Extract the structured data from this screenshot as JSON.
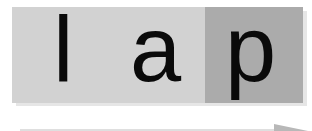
{
  "figure": {
    "letters": [
      {
        "char": "l",
        "segment": "light"
      },
      {
        "char": "a",
        "segment": "light"
      },
      {
        "char": "p",
        "segment": "dark"
      }
    ],
    "colors": {
      "light_segment": "#d2d2d2",
      "dark_segment": "#ababab",
      "text": "#0a0a0a",
      "arrow": "#bdbdbd"
    },
    "arrow": {
      "direction": "right"
    }
  }
}
